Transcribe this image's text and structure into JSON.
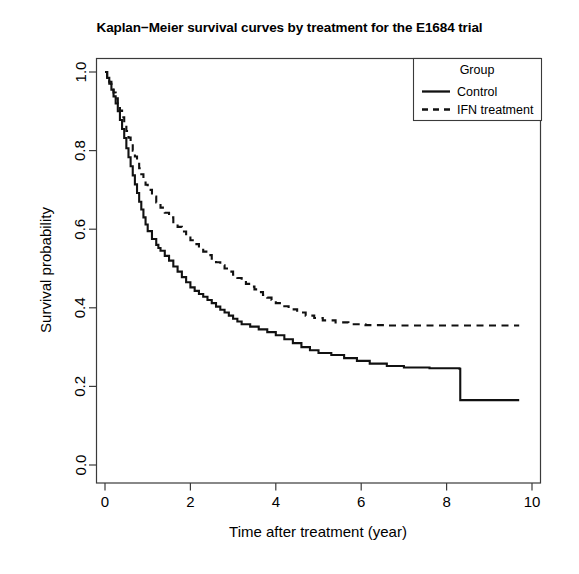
{
  "chart_data": {
    "type": "line",
    "title": "Kaplan−Meier survival curves by treatment for the E1684 trial",
    "xlabel": "Time after treatment (year)",
    "ylabel": "Survival probability",
    "xlim": [
      0,
      10
    ],
    "ylim": [
      0.0,
      1.0
    ],
    "xticks": [
      0,
      2,
      4,
      6,
      8,
      10
    ],
    "xticklabels": [
      "0",
      "2",
      "4",
      "6",
      "8",
      "10"
    ],
    "yticks": [
      0.0,
      0.2,
      0.4,
      0.6,
      0.8,
      1.0
    ],
    "yticklabels": [
      "0.0",
      "0.2",
      "0.4",
      "0.6",
      "0.8",
      "1.0"
    ],
    "grid": false,
    "legend": {
      "title": "Group",
      "position": "top-right",
      "entries": [
        {
          "label": "Control",
          "style": "solid"
        },
        {
          "label": "IFN treatment",
          "style": "dashed"
        }
      ]
    },
    "series": [
      {
        "name": "Control",
        "style": "solid",
        "step": "post",
        "points": [
          [
            0.0,
            1.0
          ],
          [
            0.05,
            0.985
          ],
          [
            0.1,
            0.97
          ],
          [
            0.15,
            0.955
          ],
          [
            0.2,
            0.938
          ],
          [
            0.25,
            0.92
          ],
          [
            0.3,
            0.9
          ],
          [
            0.35,
            0.878
          ],
          [
            0.4,
            0.855
          ],
          [
            0.45,
            0.832
          ],
          [
            0.5,
            0.806
          ],
          [
            0.55,
            0.783
          ],
          [
            0.6,
            0.76
          ],
          [
            0.65,
            0.737
          ],
          [
            0.7,
            0.714
          ],
          [
            0.75,
            0.692
          ],
          [
            0.8,
            0.67
          ],
          [
            0.85,
            0.65
          ],
          [
            0.9,
            0.63
          ],
          [
            0.95,
            0.612
          ],
          [
            1.0,
            0.595
          ],
          [
            1.1,
            0.575
          ],
          [
            1.2,
            0.56
          ],
          [
            1.25,
            0.552
          ],
          [
            1.3,
            0.545
          ],
          [
            1.4,
            0.532
          ],
          [
            1.5,
            0.52
          ],
          [
            1.6,
            0.505
          ],
          [
            1.7,
            0.492
          ],
          [
            1.8,
            0.478
          ],
          [
            1.9,
            0.465
          ],
          [
            2.0,
            0.452
          ],
          [
            2.1,
            0.443
          ],
          [
            2.2,
            0.435
          ],
          [
            2.3,
            0.428
          ],
          [
            2.4,
            0.42
          ],
          [
            2.5,
            0.412
          ],
          [
            2.6,
            0.403
          ],
          [
            2.7,
            0.395
          ],
          [
            2.8,
            0.388
          ],
          [
            2.9,
            0.38
          ],
          [
            3.0,
            0.372
          ],
          [
            3.1,
            0.365
          ],
          [
            3.2,
            0.358
          ],
          [
            3.4,
            0.352
          ],
          [
            3.6,
            0.345
          ],
          [
            3.8,
            0.338
          ],
          [
            4.0,
            0.33
          ],
          [
            4.2,
            0.32
          ],
          [
            4.4,
            0.31
          ],
          [
            4.6,
            0.3
          ],
          [
            4.8,
            0.292
          ],
          [
            5.0,
            0.285
          ],
          [
            5.3,
            0.28
          ],
          [
            5.6,
            0.272
          ],
          [
            5.9,
            0.265
          ],
          [
            6.2,
            0.258
          ],
          [
            6.6,
            0.252
          ],
          [
            7.0,
            0.248
          ],
          [
            7.6,
            0.246
          ],
          [
            8.3,
            0.245
          ],
          [
            8.32,
            0.165
          ],
          [
            9.7,
            0.165
          ]
        ]
      },
      {
        "name": "IFN treatment",
        "style": "dashed",
        "step": "post",
        "points": [
          [
            0.0,
            1.0
          ],
          [
            0.05,
            0.988
          ],
          [
            0.1,
            0.975
          ],
          [
            0.15,
            0.962
          ],
          [
            0.2,
            0.948
          ],
          [
            0.25,
            0.933
          ],
          [
            0.3,
            0.918
          ],
          [
            0.35,
            0.902
          ],
          [
            0.4,
            0.885
          ],
          [
            0.45,
            0.868
          ],
          [
            0.5,
            0.85
          ],
          [
            0.55,
            0.833
          ],
          [
            0.6,
            0.817
          ],
          [
            0.65,
            0.8
          ],
          [
            0.7,
            0.785
          ],
          [
            0.75,
            0.77
          ],
          [
            0.8,
            0.755
          ],
          [
            0.85,
            0.74
          ],
          [
            0.9,
            0.726
          ],
          [
            0.95,
            0.713
          ],
          [
            1.0,
            0.7
          ],
          [
            1.1,
            0.683
          ],
          [
            1.2,
            0.668
          ],
          [
            1.3,
            0.655
          ],
          [
            1.4,
            0.642
          ],
          [
            1.5,
            0.63
          ],
          [
            1.6,
            0.618
          ],
          [
            1.7,
            0.606
          ],
          [
            1.8,
            0.594
          ],
          [
            1.9,
            0.583
          ],
          [
            2.0,
            0.572
          ],
          [
            2.1,
            0.562
          ],
          [
            2.2,
            0.552
          ],
          [
            2.3,
            0.543
          ],
          [
            2.4,
            0.534
          ],
          [
            2.5,
            0.525
          ],
          [
            2.6,
            0.516
          ],
          [
            2.7,
            0.508
          ],
          [
            2.8,
            0.5
          ],
          [
            2.9,
            0.492
          ],
          [
            3.0,
            0.484
          ],
          [
            3.1,
            0.476
          ],
          [
            3.2,
            0.468
          ],
          [
            3.3,
            0.461
          ],
          [
            3.4,
            0.454
          ],
          [
            3.5,
            0.447
          ],
          [
            3.6,
            0.44
          ],
          [
            3.7,
            0.433
          ],
          [
            3.8,
            0.426
          ],
          [
            3.9,
            0.42
          ],
          [
            4.0,
            0.412
          ],
          [
            4.15,
            0.404
          ],
          [
            4.3,
            0.396
          ],
          [
            4.5,
            0.388
          ],
          [
            4.7,
            0.38
          ],
          [
            4.9,
            0.374
          ],
          [
            5.1,
            0.368
          ],
          [
            5.4,
            0.363
          ],
          [
            5.7,
            0.358
          ],
          [
            6.1,
            0.356
          ],
          [
            6.6,
            0.355
          ],
          [
            7.2,
            0.355
          ],
          [
            8.0,
            0.355
          ],
          [
            9.0,
            0.355
          ],
          [
            9.7,
            0.355
          ]
        ]
      }
    ]
  },
  "axes": {
    "y_title": "Survival probability",
    "x_title": "Time after treatment (year)"
  },
  "legend": {
    "title": "Group",
    "item0": "Control",
    "item1": "IFN treatment"
  }
}
